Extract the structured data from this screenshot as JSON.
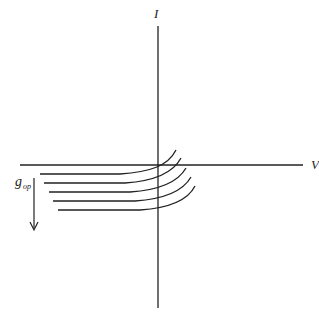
{
  "diagram": {
    "axes": {
      "x_label": "V",
      "y_label": "I"
    },
    "parameter_label": "g",
    "parameter_subscript": "op",
    "arrow_direction": "down",
    "curve_count": 5,
    "colors": {
      "stroke": "#222222",
      "background": "#ffffff"
    }
  }
}
